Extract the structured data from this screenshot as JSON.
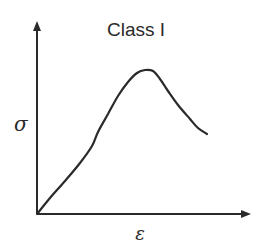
{
  "diagram": {
    "title": "Class I",
    "y_axis_label": "σ",
    "x_axis_label": "ε",
    "colors": {
      "line": "#2a2a2a",
      "background": "#ffffff"
    },
    "curve": {
      "description": "stress-strain curve rising from origin to a peak then softening",
      "points": [
        [
          37,
          214
        ],
        [
          50,
          198
        ],
        [
          65,
          181
        ],
        [
          80,
          163
        ],
        [
          92,
          146
        ],
        [
          98,
          132
        ],
        [
          108,
          114
        ],
        [
          118,
          96
        ],
        [
          128,
          82
        ],
        [
          137,
          73
        ],
        [
          145,
          70
        ],
        [
          153,
          71
        ],
        [
          160,
          79
        ],
        [
          168,
          91
        ],
        [
          178,
          105
        ],
        [
          190,
          119
        ],
        [
          198,
          128
        ],
        [
          207,
          134
        ]
      ]
    }
  }
}
